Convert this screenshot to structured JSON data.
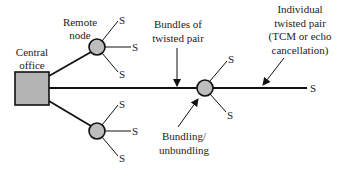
{
  "diagram": {
    "colors": {
      "node_fill": "#bdbdbd",
      "office_fill": "#b4b4b4",
      "line": "#111111",
      "text": "#222222"
    },
    "central_office": {
      "label_line1": "Central",
      "label_line2": "office"
    },
    "remote_node": {
      "label_line1": "Remote",
      "label_line2": "node"
    },
    "bundles": {
      "label_line1": "Bundles of",
      "label_line2": "twisted pair"
    },
    "individual": {
      "label_line1": "Individual",
      "label_line2": "twisted pair",
      "label_line3": "(TCM or echo",
      "label_line4": "cancellation)"
    },
    "bundling": {
      "label_line1": "Bundling/",
      "label_line2": "unbundling"
    },
    "subscriber_label": "S",
    "subscribers": {
      "upper_node": [
        "S",
        "S",
        "S"
      ],
      "lower_node": [
        "S",
        "S",
        "S"
      ],
      "bundling_node": [
        "S",
        "S"
      ],
      "end": "S"
    }
  }
}
